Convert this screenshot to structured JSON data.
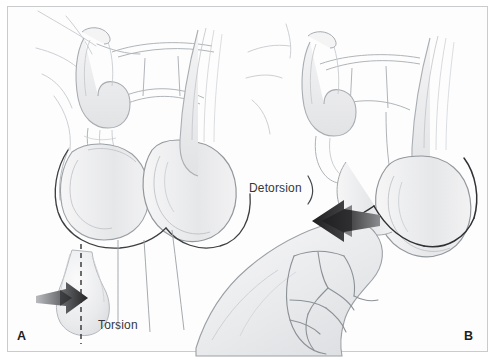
{
  "figure": {
    "style": "pencil line-art medical illustration",
    "background_color": "#ffffff",
    "frame_color": "#c9cbcd"
  },
  "panels": [
    {
      "letter": "A",
      "label": "Torsion",
      "description": "Scrotal anatomy with twisted spermatic cord; testis shown below with a dashed vertical axis and a rightward rotation arrow indicating torsion",
      "arrow_direction": "right",
      "arrow_color": "#3a3a3c",
      "axis_line_style": "dashed"
    },
    {
      "letter": "B",
      "label": "Detorsion",
      "description": "A clinician's hand grasps the scrotum; a large leftward arrow indicates the outward rotation direction for manual detorsion",
      "arrow_direction": "left",
      "arrow_color": "#2e2e30"
    }
  ],
  "labels": {
    "torsion": "Torsion",
    "detorsion": "Detorsion",
    "panel_a": "A",
    "panel_b": "B"
  },
  "colors": {
    "ink_dark": "#2e2e30",
    "ink_line": "#8c9094",
    "ink_light": "#c3c7cb",
    "shade_fill": "#ececee",
    "text": "#35383b",
    "letter": "#1d1d1f"
  }
}
